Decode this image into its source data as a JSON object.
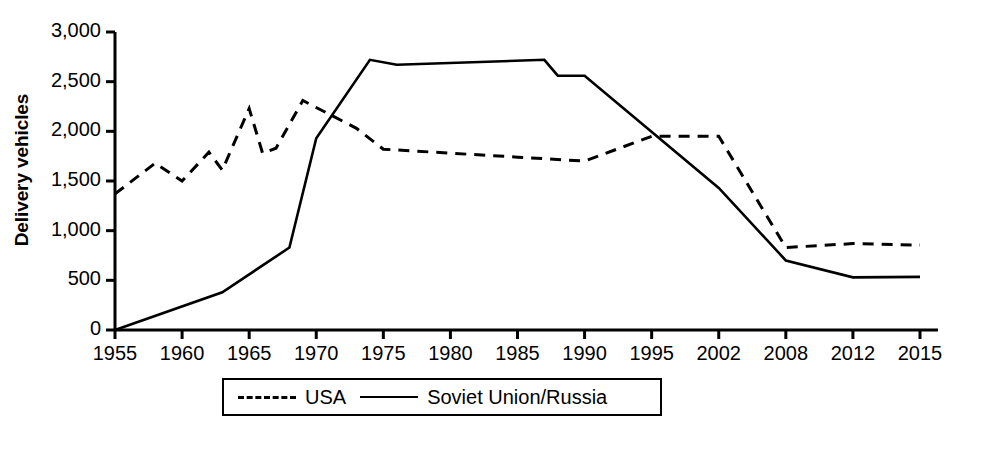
{
  "chart_data": {
    "type": "line",
    "title": "",
    "xlabel": "",
    "ylabel": "Delivery vehicles",
    "ylim": [
      0,
      3000
    ],
    "ytick_values": [
      0,
      500,
      1000,
      1500,
      2000,
      2500,
      3000
    ],
    "ytick_labels": [
      "0",
      "500",
      "1,000",
      "1,500",
      "2,000",
      "2,500",
      "3,000"
    ],
    "grid": false,
    "legend_position": "bottom-center",
    "categories": [
      "1955",
      "1960",
      "1965",
      "1970",
      "1975",
      "1980",
      "1985",
      "1990",
      "1995",
      "2002",
      "2008",
      "2012",
      "2015"
    ],
    "x_axis_note": "categorical axis: evenly spaced ticks although year intervals are irregular after 1995",
    "series": [
      {
        "name": "USA",
        "style": "dashed",
        "color": "#000000",
        "points": [
          {
            "year": 1955,
            "value": 1370
          },
          {
            "year": 1958,
            "value": 1680
          },
          {
            "year": 1960,
            "value": 1500
          },
          {
            "year": 1962,
            "value": 1790
          },
          {
            "year": 1963,
            "value": 1610
          },
          {
            "year": 1965,
            "value": 2230
          },
          {
            "year": 1966,
            "value": 1780
          },
          {
            "year": 1967,
            "value": 1830
          },
          {
            "year": 1969,
            "value": 2310
          },
          {
            "year": 1973,
            "value": 2030
          },
          {
            "year": 1975,
            "value": 1820
          },
          {
            "year": 1985,
            "value": 1740
          },
          {
            "year": 1990,
            "value": 1700
          },
          {
            "year": 1995,
            "value": 1950
          },
          {
            "year": 2002,
            "value": 1950
          },
          {
            "year": 2008,
            "value": 830
          },
          {
            "year": 2012,
            "value": 870
          },
          {
            "year": 2015,
            "value": 855
          }
        ]
      },
      {
        "name": "Soviet Union/Russia",
        "style": "solid",
        "color": "#000000",
        "points": [
          {
            "year": 1955,
            "value": 0
          },
          {
            "year": 1963,
            "value": 380
          },
          {
            "year": 1968,
            "value": 830
          },
          {
            "year": 1970,
            "value": 1930
          },
          {
            "year": 1974,
            "value": 2720
          },
          {
            "year": 1976,
            "value": 2670
          },
          {
            "year": 1987,
            "value": 2720
          },
          {
            "year": 1988,
            "value": 2560
          },
          {
            "year": 1990,
            "value": 2560
          },
          {
            "year": 2002,
            "value": 1430
          },
          {
            "year": 2008,
            "value": 700
          },
          {
            "year": 2012,
            "value": 530
          },
          {
            "year": 2015,
            "value": 535
          }
        ]
      }
    ],
    "legend": [
      {
        "label": "USA",
        "style": "dashed"
      },
      {
        "label": "Soviet Union/Russia",
        "style": "solid"
      }
    ]
  },
  "geometry": {
    "plot_left": 115,
    "plot_right": 920,
    "plot_top": 32,
    "plot_bottom": 330,
    "axis_right_end": 938,
    "legend": {
      "left": 222,
      "top": 378,
      "width": 440,
      "height": 38
    }
  }
}
